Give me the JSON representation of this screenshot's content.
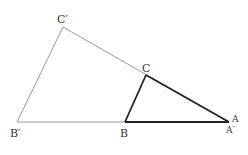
{
  "diagram": {
    "labels": {
      "c_prime": "C′",
      "c": "C",
      "b_prime": "B′",
      "b": "B",
      "a": "A",
      "a_prime": "A′"
    },
    "colors": {
      "thin_line": "#999999",
      "bold_line": "#222222",
      "label": "#333333"
    }
  }
}
